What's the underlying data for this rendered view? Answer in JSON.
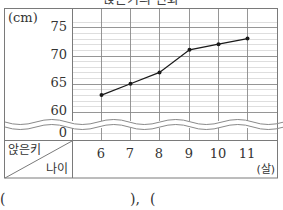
{
  "title": "앉은키의 변화",
  "chart_data": {
    "type": "line",
    "title": "앉은키의 변화",
    "xlabel": "나이",
    "x_unit": "(살)",
    "ylabel": "앉은키",
    "y_unit": "(cm)",
    "categories": [
      6,
      7,
      8,
      9,
      10,
      11
    ],
    "series": [
      {
        "name": "앉은키",
        "values": [
          63,
          65,
          67,
          71,
          72,
          73
        ]
      }
    ],
    "y_ticks": [
      0,
      60,
      65,
      70,
      75
    ],
    "ylim": [
      60,
      76
    ],
    "y_axis_break": "wavy break between 0 and 60",
    "grid": {
      "major_step": 5,
      "minor_step": 1,
      "vertical_lines": true
    },
    "legend": "none"
  },
  "axis": {
    "y_unit_label": "(cm)",
    "y_tick_labels": [
      "75",
      "70",
      "65",
      "60",
      "0"
    ],
    "x_tick_labels": [
      "6",
      "7",
      "8",
      "9",
      "10",
      "11"
    ],
    "x_unit_label": "(살)",
    "header_top_label": "앉은키",
    "header_bottom_label": "나이"
  },
  "answer": {
    "open1": "(",
    "close1": "),",
    "open2": "("
  },
  "colors": {
    "line": "#1a1a1a",
    "grid_major": "#8a8a8a",
    "grid_minor": "#c8c8c8",
    "frame": "#7a7a7a"
  }
}
